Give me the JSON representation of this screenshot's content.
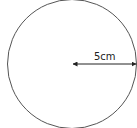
{
  "diagram": {
    "shape": "circle",
    "radius_label": "5cm",
    "stroke_color": "#555555",
    "arrow_color": "#222222"
  }
}
